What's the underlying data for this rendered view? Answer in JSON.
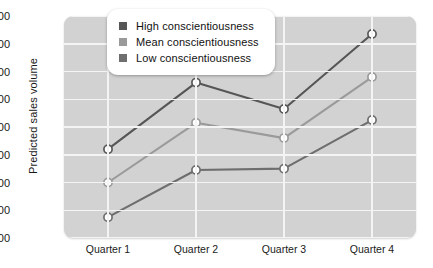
{
  "chart_data": {
    "type": "line",
    "title": "",
    "xlabel": "",
    "ylabel": "Predicted sales volume",
    "categories": [
      "Quarter 1",
      "Quarter 2",
      "Quarter 3",
      "Quarter 4"
    ],
    "ylim": [
      900,
      1700
    ],
    "ytick_labels": [
      "1,700",
      "1,600",
      "1,500",
      "1,400",
      "1,300",
      "1,200",
      "1,100",
      "1,000",
      "900"
    ],
    "ytick_values": [
      1700,
      1600,
      1500,
      1400,
      1300,
      1200,
      1100,
      1000,
      900
    ],
    "grid": true,
    "legend_position": "top-center",
    "series": [
      {
        "name": "High conscientiousness",
        "color": "#565656",
        "values": [
          1220,
          1460,
          1365,
          1635
        ]
      },
      {
        "name": "Mean conscientiousness",
        "color": "#9a9a9a",
        "values": [
          1100,
          1315,
          1260,
          1480
        ]
      },
      {
        "name": "Low conscientiousness",
        "color": "#6e6e6e",
        "values": [
          975,
          1145,
          1150,
          1325
        ]
      }
    ]
  },
  "style": {
    "plot_background": "#d2d2d2",
    "gridline_color": "#f4f4f4",
    "marker_fill": "#ffffff",
    "text_color": "#1a1a1a"
  }
}
